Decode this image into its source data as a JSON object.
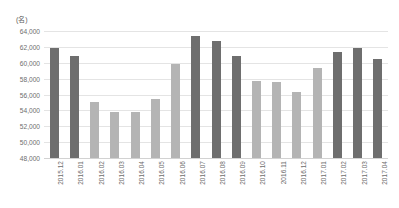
{
  "chart_data": {
    "type": "bar",
    "title": "",
    "subtitle": "",
    "xlabel": "",
    "ylabel": "",
    "unit_label": "(名)",
    "grid": true,
    "legend": "none",
    "ylim": [
      48000,
      64000
    ],
    "ytick_step": 2000,
    "ytick_labels": [
      "64,000",
      "62,000",
      "60,000",
      "58,000",
      "56,000",
      "54,000",
      "52,000",
      "50,000",
      "48,000"
    ],
    "ytick_values": [
      64000,
      62000,
      60000,
      58000,
      56000,
      54000,
      52000,
      50000,
      48000
    ],
    "categories": [
      "2015.12",
      "2016.01",
      "2016.02",
      "2016.03",
      "2016.04",
      "2016.05",
      "2016.06",
      "2016.07",
      "2016.08",
      "2016.09",
      "2016.10",
      "2016.11",
      "2016.12",
      "2017.01",
      "2017.02",
      "2017.03",
      "2017.04"
    ],
    "values": [
      61800,
      60850,
      55000,
      53800,
      53800,
      55400,
      59900,
      63350,
      62700,
      60900,
      57700,
      57600,
      56300,
      59300,
      61300,
      61900,
      60500
    ],
    "bar_shades": [
      "dark",
      "dark",
      "light",
      "light",
      "light",
      "light",
      "light",
      "dark",
      "dark",
      "dark",
      "light",
      "light",
      "light",
      "light",
      "dark",
      "dark",
      "dark"
    ],
    "colors": {
      "bar_dark": "#6e6e6e",
      "bar_light": "#b4b4b4",
      "gridline": "#e4e4e4",
      "axis": "#d2d2d2",
      "text": "#6d6d6d",
      "background": "#ffffff"
    }
  }
}
